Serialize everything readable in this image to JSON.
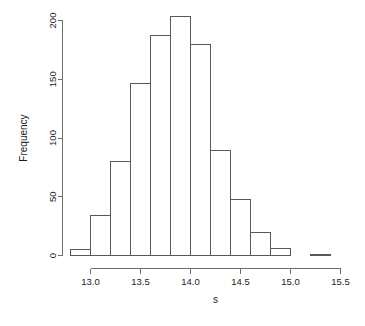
{
  "chart_data": {
    "type": "bar",
    "title": "",
    "subtitle": "",
    "xlabel": "s",
    "ylabel": "Frequency",
    "xlim": [
      12.75,
      15.45
    ],
    "ylim": [
      0,
      205
    ],
    "grid": false,
    "legend": null,
    "bin_width": 0.2,
    "bin_edges": [
      12.8,
      13.0,
      13.2,
      13.4,
      13.6,
      13.8,
      14.0,
      14.2,
      14.4,
      14.6,
      14.8,
      15.0,
      15.2,
      15.4
    ],
    "categories": [
      "12.8-13.0",
      "13.0-13.2",
      "13.2-13.4",
      "13.4-13.6",
      "13.6-13.8",
      "13.8-14.0",
      "14.0-14.2",
      "14.2-14.4",
      "14.4-14.6",
      "14.6-14.8",
      "14.8-15.0",
      "15.0-15.2",
      "15.2-15.4"
    ],
    "values": [
      5,
      34,
      80,
      146,
      187,
      203,
      180,
      89,
      48,
      20,
      6,
      0,
      1
    ],
    "x_ticks": [
      13.0,
      13.5,
      14.0,
      14.5,
      15.0,
      15.5
    ],
    "x_tick_labels": [
      "13.0",
      "13.5",
      "14.0",
      "14.5",
      "15.0",
      "15.5"
    ],
    "y_ticks": [
      0,
      50,
      100,
      150,
      200
    ],
    "y_tick_labels": [
      "0",
      "50",
      "100",
      "150",
      "200"
    ],
    "colors": {
      "bar_fill": "#ffffff",
      "bar_stroke": "#595959",
      "axis": "#6e6e6e",
      "text": "#1a1a1a",
      "background": "#ffffff"
    }
  },
  "axes": {
    "x_title": "s",
    "y_title": "Frequency"
  }
}
